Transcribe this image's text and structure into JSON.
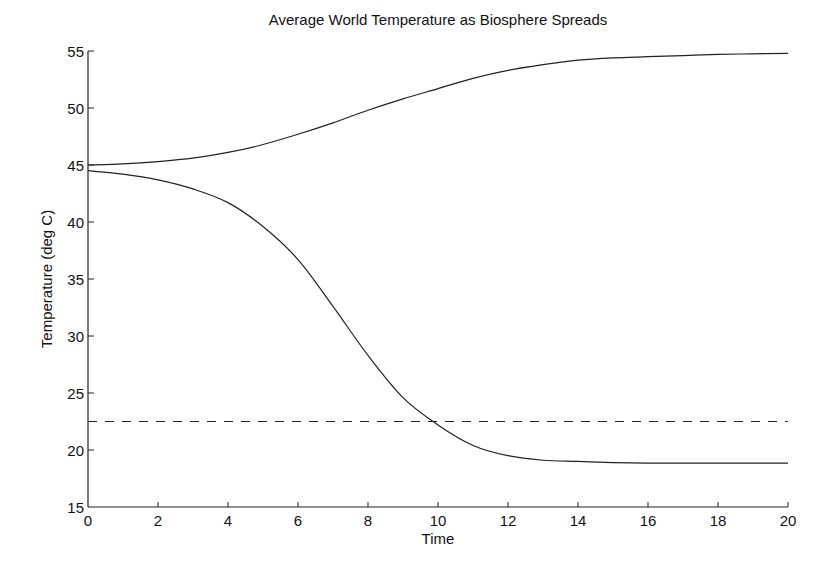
{
  "chart_data": {
    "type": "line",
    "title": "Average World Temperature as Biosphere Spreads",
    "xlabel": "Time",
    "ylabel": "Temperature (deg C)",
    "xlim": [
      0,
      20
    ],
    "ylim": [
      15,
      55
    ],
    "xticks": [
      0,
      2,
      4,
      6,
      8,
      10,
      12,
      14,
      16,
      18,
      20
    ],
    "yticks": [
      15,
      20,
      25,
      30,
      35,
      40,
      45,
      50,
      55
    ],
    "grid": false,
    "legend": null,
    "series": [
      {
        "name": "upper",
        "style": "solid",
        "x": [
          0,
          1,
          2,
          3,
          4,
          5,
          6,
          7,
          8,
          9,
          10,
          11,
          12,
          13,
          14,
          15,
          16,
          17,
          18,
          19,
          20
        ],
        "y": [
          45.0,
          45.1,
          45.3,
          45.6,
          46.1,
          46.8,
          47.7,
          48.7,
          49.8,
          50.8,
          51.7,
          52.6,
          53.3,
          53.8,
          54.2,
          54.4,
          54.5,
          54.6,
          54.7,
          54.75,
          54.8
        ]
      },
      {
        "name": "lower",
        "style": "solid",
        "x": [
          0,
          1,
          2,
          3,
          4,
          5,
          6,
          7,
          8,
          9,
          10,
          11,
          12,
          13,
          14,
          15,
          16,
          17,
          18,
          19,
          20
        ],
        "y": [
          44.5,
          44.2,
          43.7,
          42.9,
          41.7,
          39.6,
          36.7,
          32.6,
          28.3,
          24.6,
          22.2,
          20.4,
          19.5,
          19.1,
          19.0,
          18.9,
          18.85,
          18.85,
          18.85,
          18.85,
          18.85
        ]
      },
      {
        "name": "reference",
        "style": "dashed",
        "x": [
          0,
          20
        ],
        "y": [
          22.5,
          22.5
        ]
      }
    ]
  },
  "axis": {
    "x_tick_labels": [
      "0",
      "2",
      "4",
      "6",
      "8",
      "10",
      "12",
      "14",
      "16",
      "18",
      "20"
    ],
    "y_tick_labels": [
      "15",
      "20",
      "25",
      "30",
      "35",
      "40",
      "45",
      "50",
      "55"
    ]
  }
}
